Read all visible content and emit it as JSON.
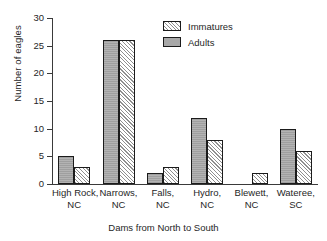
{
  "chart_data": {
    "type": "bar",
    "title": "",
    "xlabel": "Dams from North to South",
    "ylabel": "Number of eagles",
    "ylim": [
      0,
      30
    ],
    "yticks": [
      0,
      5,
      10,
      15,
      20,
      25,
      30
    ],
    "grid": false,
    "legend_position": "top-center",
    "categories": [
      "High Rock, NC",
      "Narrows, NC",
      "Falls, NC",
      "Hydro, NC",
      "Blewett, NC",
      "Wateree, SC"
    ],
    "category_lines": [
      [
        "High Rock,",
        "NC"
      ],
      [
        "Narrows,",
        "NC"
      ],
      [
        "Falls,",
        "NC"
      ],
      [
        "Hydro,",
        "NC"
      ],
      [
        "Blewett,",
        "NC"
      ],
      [
        "Wateree,",
        "SC"
      ]
    ],
    "series": [
      {
        "name": "Adults",
        "fill": "solid-gray",
        "color": "#a8a8a8",
        "values": [
          5,
          26,
          2,
          12,
          0,
          10
        ]
      },
      {
        "name": "Immatures",
        "fill": "diagonal-hatch",
        "color": "#f2f2f2",
        "values": [
          3,
          26,
          3,
          8,
          2,
          6
        ]
      }
    ]
  },
  "legend": {
    "items": [
      {
        "label": "Immatures",
        "swatch": "hatch-swatch"
      },
      {
        "label": "Adults",
        "swatch": "solid-swatch"
      }
    ]
  },
  "axes": {
    "y_title": "Number of eagles",
    "x_title": "Dams from North to South",
    "y_tick_labels": [
      "0",
      "5",
      "10",
      "15",
      "20",
      "25",
      "30"
    ]
  },
  "colors": {
    "axis": "#3a3a3a",
    "bar_outline": "#1b1b1b",
    "adults_fill": "#a8a8a8",
    "immatures_fill": "#f2f2f2",
    "background": "#ffffff",
    "text": "#262626"
  }
}
